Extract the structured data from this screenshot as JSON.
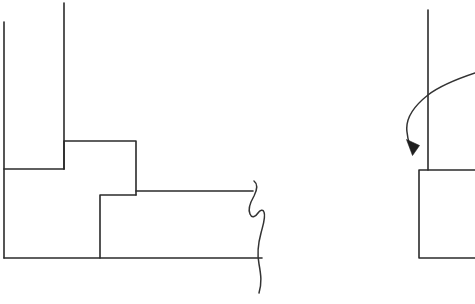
{
  "document": {
    "title": "Technical Line Drawing",
    "background_color": "#ffffff",
    "ink_color": "#2b2b2b",
    "width": 475,
    "height": 304,
    "description": "Hand-drawn black-and-white engineering sketch with a stepped profile on the left, a break-line symbol at its right edge, and a partial rectangle on the right annotated by a curved leader arrow."
  },
  "figures": {
    "left_figure": {
      "name": "stepped-profile",
      "elements": {
        "outer_left_wall": {
          "name": "outer-left-vertical-line",
          "path": "M 4 22 L 4 258"
        },
        "inner_tall_wall": {
          "name": "inner-tall-vertical-line",
          "path": "M 64 3 L 64 169"
        },
        "first_step_shelf": {
          "name": "first-step-horizontal-line",
          "path": "M 4 169 L 64 169"
        },
        "upper_step_riser_run": {
          "name": "upper-step-outline",
          "path": "M 64 169 L 64 141 L 136 141 L 136 195"
        },
        "lower_step_outline": {
          "name": "lower-step-outline",
          "path": "M 136 195 L 100 195 L 100 258"
        },
        "lower_shelf_top": {
          "name": "lower-shelf-top-horizontal-line",
          "path": "M 136 191 L 253 191"
        },
        "base_line": {
          "name": "base-horizontal-line",
          "path": "M 4 258 L 262 258"
        }
      }
    },
    "break_symbol": {
      "name": "break-line-symbol",
      "path": "M 254 181 C 258 184 257 190 254 196 C 250 203 248 210 250 214 C 252 219 256 216 258 213 C 260 210 263 209 264 212 C 266 217 263 225 261 233 C 258 244 257 254 259 264 C 261 275 262 283 259 293"
    },
    "right_figure": {
      "name": "partial-rectangle-with-leader",
      "elements": {
        "center_vertical_line": {
          "name": "center-vertical-line",
          "path": "M 428 10 L 428 170"
        },
        "rectangle_outline": {
          "name": "partial-rectangle-outline",
          "path": "M 475 170 L 419 170 L 419 258 L 475 258"
        },
        "leader_curve": {
          "name": "leader-arrow-curve",
          "path": "M 475 73 C 460 78 441 85 428 95 C 414 106 405 118 407 132 C 408 141 410 147 413 152"
        },
        "arrow_head": {
          "name": "leader-arrow-head",
          "points": "412.5,155.5 406.5,139.5 419.5,145.5"
        }
      }
    }
  }
}
